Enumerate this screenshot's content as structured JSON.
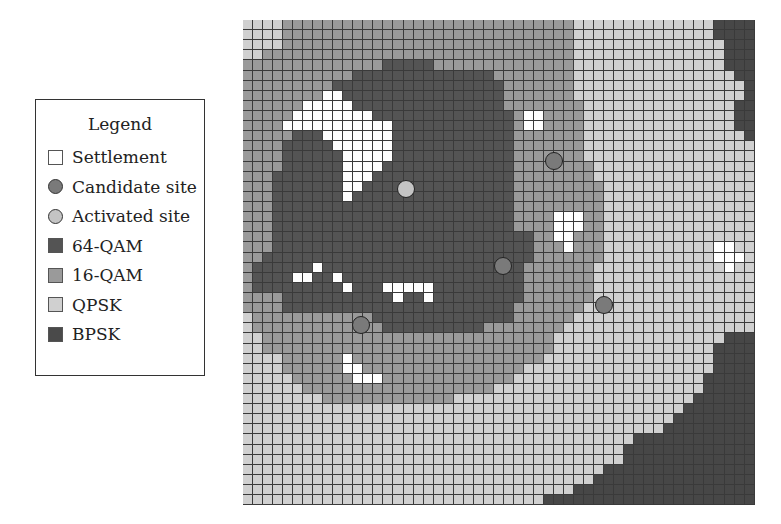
{
  "legend": {
    "title": "Legend",
    "items": [
      {
        "label": "Settlement",
        "kind": "square",
        "color": "#ffffff"
      },
      {
        "label": "Candidate site",
        "kind": "circle",
        "color": "#7a7a7a"
      },
      {
        "label": "Activated site",
        "kind": "circle",
        "color": "#c4c4c4"
      },
      {
        "label": "64-QAM",
        "kind": "square",
        "color": "#545454"
      },
      {
        "label": "16-QAM",
        "kind": "square",
        "color": "#9a9a9a"
      },
      {
        "label": "QPSK",
        "kind": "square",
        "color": "#d0d0d0"
      },
      {
        "label": "BPSK",
        "kind": "square",
        "color": "#4a4a4a"
      }
    ]
  },
  "map": {
    "cols": 51,
    "rows_count": 48,
    "palette": {
      "W": "#ffffff",
      "D": "#545454",
      "M": "#9a9a9a",
      "L": "#d0d0d0",
      "B": "#474747"
    },
    "rows": [
      "LLLLMMMMMMMMMMMMMMMMMMMMMMMMMMMMMLLLLLLLLLLLLLLBBBBB",
      "LLLLMMMMMMMMMMMMMMMMMMMMMMMMMMMMMLLLLLLLLLLLLLLBBBBB",
      "LLLLMMMMMMMMMMMMMMMMMMMMMMMMMMMMMLLLLLLLLLLLLLLLBBBB",
      "LLMMMMMMMMMMMMMMMMMMMMMMMMMMMMMMMLLLLLLLLLLLLLLLBBBB",
      "MMMMMMMMMMMMMMDDDDDMMMMMMMMMMMMMMLLLLLLLLLLLLLLLBBBB",
      "MMMMMMMMMMMDDDDDDDDDDDDDDMMMMMMMMLLLLLLLLLLLLLLLLBBB",
      "MMMMMMMMMDDDDDDDDDDDDDDDDDMMMMMMMLLLLLLLLLLLLLLLLLBB",
      "MMMMMMMMWWDDDDDDDDDDDDDDDDMMMMMMMLLLLLLLLLLLLLLLLLBB",
      "MMMMMMWWWWWDDDDDDDDDDDDDDDMMMMMMMMLLLLLLLLLLLLLLLBBB",
      "MMMMMWWWWWWWWDDDDDDDDDDDDDDMWWMMMMLLLLLLLLLLLLLLLBBB",
      "MMMMWWWWWWWWWWWDDDDDDDDDDDDMWWMMMMLLLLLLLLLLLLLLLBBB",
      "MMMMMDDDWWWWWWWDDDDDDDDDDDDMMMMMMMLLLLLLLLLLLLLLLLBB",
      "MMMMDDDDDWWWWWWDDDDDDDDDDDDMMMMMMMLLLLLLLLLLLLLLLLLL",
      "MMMMDDDDDDWWWWWDDDDDDDDDDDDMMMMMMMLLLLLLLLLLLLLLLLLL",
      "MMMMDDDDDDWWWWDDDDDDDDDDDDDMMMMMMMMLLLLLLLLLLLLLLLLL",
      "MMMDDDDDDDWWWDDDDDDDDDDDDDDMMMMMMMMLLLLLLLLLLLLLLLLL",
      "MMMDDDDDDDWWDDDDDDDDDDDDDDDMMMMMMMMMLLLLLLLLLLLLLLLL",
      "MMMDDDDDDDWDDDDDDDDDDDDDDDDMMMMMMMMMLLLLLLLLLLLLLLLL",
      "MMMDDDDDDDDDDDDDDDDDDDDDDDDMMMMMMMMMLLLLLLLLLLLLLLLL",
      "MMMDDDDDDDDDDDDDDDDDDDDDDDDMMMMWWWMMLLLLLLLLLLLLLLLL",
      "MMMDDDDDDDDDDDDDDDDDDDDDDDDMMMMWWWMMLLLLLLLLLLLLLLLL",
      "MMMDDDDDDDDDDDDDDDDDDDDDDDDDDMMWWMMMLLLLLLLLLLLLLLLL",
      "MMMDDDDDDDDDDDDDDDDDDDDDDDDDDMMMWMMMLLLLLLLLLLLWWLLL",
      "MMDDDDDDDDDDDDDDDDDDDDDDDDDDDMMMMMMMLLLLLLLLLLLWWWLL",
      "MDDDDDDWDDDDDDDDDDDDDDDDDDDDMMMMMMMLLLLLLLLLLLLLWLLL",
      "MDDDDWWDDWDDDDDDDDDDDDDDDDDDMMMMMMMLLLLLLLLLLLLLLLLL",
      "MDDDDDDDDDWDDDWWWWWDDDDDDDDDMMMMMMMLLLLLLLLLLLLLLLLL",
      "MMMMDDDDDDDDDDDWDDWDDDDDDDDDMMMMMMMLLLLLLLLLLLLLLLLL",
      "MMMMDDDDDDDDDDDDDDDDDDDDDDDMMMMMMMLLLLLLLLLLLLLLLLLL",
      "LMMMMMMMMMMMMDDDDDDDDDDDDDDMMMMMMLLLLLLLLLLLLLLLLLLL",
      "LMMMMMMMMMMMMMDDDDDDDDDDMMMMMMMMLLLLLLLLLLLLLLLLLLLL",
      "LLMMMMMMMMMMMMMMMMMMMMMMMMMMMMMLLLLLLLLLLLLLLLLLBBBB",
      "LLMMMMMMMMMMMMMMMMMMMMMMMMMMMMMLLLLLLLLLLLLLLLLBBBBB",
      "LLLLMMMMMMWMMMMMMMMMMMMMMMMMMMLLLLLLLLLLLLLLLLLBBBBB",
      "LLLLMMMMMMWWMMMMMMMMMMMMMMMMLLLLLLLLLLLLLLLLLLLBBBBB",
      "LLLLLMMMMMMWWWMMMMMMMMMMMMMLLLLLLLLLLLLLLLLLLLBBBBBB",
      "LLLLLLMMMMMMMMMMMMMMMMMMMLLLLLLLLLLLLLLLLLLLLLBBBBBB",
      "LLLLLLLLMMMMMMMMMMMMMLLLLLLLLLLLLLLLLLLLLLLLLBBBBBBB",
      "LLLLLLLLLLLLLLLLLLLLLLLLLLLLLLLLLLLLLLLLLLLLBBBBBBBB",
      "LLLLLLLLLLLLLLLLLLLLLLLLLLLLLLLLLLLLLLLLLLLBBBBBBBBB",
      "LLLLLLLLLLLLLLLLLLLLLLLLLLLLLLLLLLLLLLLLLLBBBBBBBBBB",
      "LLLLLLLLLLLLLLLLLLLLLLLLLLLLLLLLLLLLLLLBBBBBBBBBBBBB",
      "LLLLLLLLLLLLLLLLLLLLLLLLLLLLLLLLLLLLLLBBBBBBBBBBBBBB",
      "LLLLLLLLLLLLLLLLLLLLLLLLLLLLLLLLLLLLLLBBBBBBBBBBBBBB",
      "LLLLLLLLLLLLLLLLLLLLLLLLLLLLLLLLLLLLBBBBBBBBBBBBBBBB",
      "LLLLLLLLLLLLLLLLLLLLLLLLLLLLLLLLLLLBBBBBBBBBBBBBBBBB",
      "LLLLLLLLLLLLLLLLLLLLLLLLLLLLLLLLLBBBBBBBBBBBBBBBBBBB",
      "LLLLLLLLLLLLLLLLLLLLLLLLLLLLLLBBBBBBBBBBBBBBBBBBBBBB"
    ],
    "sites": [
      {
        "type": "activated",
        "x": 406,
        "y": 189
      },
      {
        "type": "candidate",
        "x": 554,
        "y": 161
      },
      {
        "type": "candidate",
        "x": 503,
        "y": 266
      },
      {
        "type": "candidate",
        "x": 604,
        "y": 305
      },
      {
        "type": "candidate",
        "x": 361,
        "y": 325
      }
    ],
    "site_colors": {
      "candidate": "#7a7a7a",
      "activated": "#c4c4c4"
    }
  }
}
